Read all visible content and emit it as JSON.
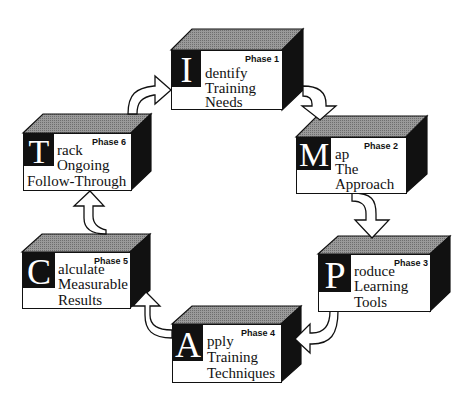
{
  "diagram": {
    "acronym": "IMPACT",
    "colors": {
      "box_front": "#ffffff",
      "box_top": "#8a8a8a",
      "box_side": "#111111",
      "initial_bg": "#111111",
      "initial_fg": "#ffffff",
      "arrow_fill": "#ffffff",
      "arrow_stroke": "#111111"
    },
    "phases": [
      {
        "phase": "Phase 1",
        "initial": "I",
        "line1": "dentify",
        "line2": "Training",
        "line3": "Needs"
      },
      {
        "phase": "Phase 2",
        "initial": "M",
        "line1": "ap",
        "line2": "The",
        "line3": "Approach"
      },
      {
        "phase": "Phase 3",
        "initial": "P",
        "line1": "roduce",
        "line2": "Learning",
        "line3": "Tools"
      },
      {
        "phase": "Phase 4",
        "initial": "A",
        "line1": "pply",
        "line2": "Training",
        "line3": "Techniques"
      },
      {
        "phase": "Phase 5",
        "initial": "C",
        "line1": "alculate",
        "line2": "Measurable",
        "line3": "Results"
      },
      {
        "phase": "Phase 6",
        "initial": "T",
        "line1": "rack",
        "line2": "Ongoing",
        "line3": "Follow-Through"
      }
    ],
    "arrows": [
      {
        "from": "Phase 1",
        "to": "Phase 2",
        "icon": "curved-arrow-down-icon"
      },
      {
        "from": "Phase 2",
        "to": "Phase 3",
        "icon": "curved-arrow-down-icon"
      },
      {
        "from": "Phase 3",
        "to": "Phase 4",
        "icon": "curved-arrow-left-icon"
      },
      {
        "from": "Phase 4",
        "to": "Phase 5",
        "icon": "curved-arrow-up-icon"
      },
      {
        "from": "Phase 5",
        "to": "Phase 6",
        "icon": "curved-arrow-up-icon"
      },
      {
        "from": "Phase 6",
        "to": "Phase 1",
        "icon": "curved-arrow-right-icon"
      }
    ]
  }
}
